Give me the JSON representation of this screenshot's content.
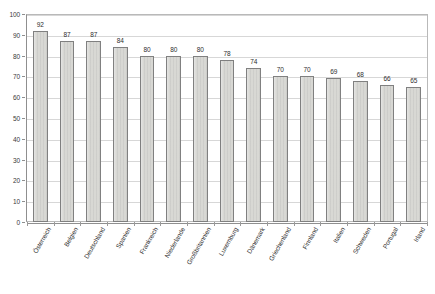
{
  "chart_data": {
    "type": "bar",
    "title": "",
    "subtitle": "",
    "xlabel": "",
    "ylabel": "",
    "ylim": [
      0,
      100
    ],
    "ytick_step": 10,
    "yticks": [
      0,
      10,
      20,
      30,
      40,
      50,
      60,
      70,
      80,
      90,
      100
    ],
    "grid": true,
    "legend": false,
    "legend_position": "none",
    "data_labels": true,
    "categories": [
      "Österreich",
      "Belgien",
      "Deutschland",
      "Spanien",
      "Frankreich",
      "Niederlande",
      "Großbritannien",
      "Luxemburg",
      "Dänemark",
      "Griechenland",
      "Finnland",
      "Italien",
      "Schweden",
      "Portugal",
      "Irland"
    ],
    "values": [
      92,
      87,
      87,
      84,
      80,
      80,
      80,
      78,
      74,
      70,
      70,
      69,
      68,
      66,
      65
    ],
    "series": [
      {
        "name": "",
        "values": [
          92,
          87,
          87,
          84,
          80,
          80,
          80,
          78,
          74,
          70,
          70,
          69,
          68,
          66,
          65
        ]
      }
    ]
  },
  "style": {
    "bar_fill": "#d8d8d4",
    "bar_border": "#808080",
    "gridline_color": "#d7d7d7",
    "axis_color": "#8f8f8f",
    "text_color": "#2e2e2e",
    "background": "#ffffff"
  }
}
